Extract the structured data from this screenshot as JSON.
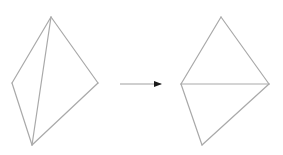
{
  "diagram": {
    "colors": {
      "edge": "#a9a9a9",
      "arrow_shaft": "#a0a0a0",
      "arrow_head": "#1a1a1a",
      "background": "#ffffff"
    },
    "before": {
      "label": "",
      "vertices": {
        "top": [
          51,
          17
        ],
        "left": [
          12,
          83
        ],
        "bottom": [
          32,
          145
        ],
        "right": [
          98,
          83
        ]
      },
      "edges": [
        [
          "top",
          "left"
        ],
        [
          "left",
          "bottom"
        ],
        [
          "bottom",
          "right"
        ],
        [
          "right",
          "top"
        ],
        [
          "top",
          "bottom"
        ]
      ],
      "diagonal": [
        "top",
        "bottom"
      ]
    },
    "arrow": {
      "from": [
        120,
        84
      ],
      "to": [
        161,
        84
      ]
    },
    "after": {
      "label": "",
      "vertices": {
        "top": [
          221,
          17
        ],
        "left": [
          181,
          84
        ],
        "bottom": [
          202,
          145
        ],
        "right": [
          269,
          84
        ]
      },
      "edges": [
        [
          "top",
          "left"
        ],
        [
          "left",
          "bottom"
        ],
        [
          "bottom",
          "right"
        ],
        [
          "right",
          "top"
        ],
        [
          "left",
          "right"
        ]
      ],
      "diagonal": [
        "left",
        "right"
      ]
    }
  }
}
